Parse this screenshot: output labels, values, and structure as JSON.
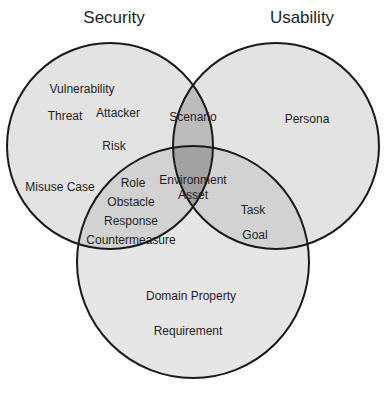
{
  "diagram": {
    "type": "venn",
    "sets": [
      {
        "name": "Security",
        "title": "Security"
      },
      {
        "name": "Usability",
        "title": "Usability"
      },
      {
        "name": "Requirements",
        "title": ""
      }
    ],
    "colors": {
      "single": "#e3e3e3",
      "double": "#bdbdbd",
      "triple": "#9f9f9f",
      "stroke": "#1a1a1a"
    },
    "regions": {
      "security_only": [
        "Vulnerability",
        "Threat",
        "Attacker",
        "Risk",
        "Misuse Case"
      ],
      "usability_only": [
        "Persona"
      ],
      "bottom_only": [
        "Domain Property",
        "Requirement"
      ],
      "security_usability": [
        "Scenario"
      ],
      "security_bottom": [
        "Role",
        "Obstacle",
        "Response",
        "Countermeasure"
      ],
      "usability_bottom": [
        "Task",
        "Goal"
      ],
      "all_three": [
        "Environment",
        "Asset"
      ]
    }
  }
}
